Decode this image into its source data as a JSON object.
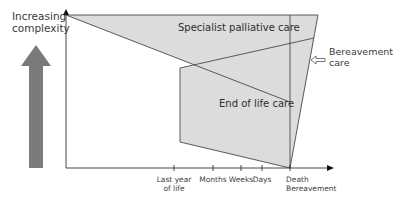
{
  "y_axis": {
    "label_line1": "Increasing",
    "label_line2": "complexity",
    "arrow": "up-arrow-icon"
  },
  "regions": {
    "specialist": "Specialist palliative care",
    "end_of_life": "End of life care",
    "bereavement_line1": "Bereavement",
    "bereavement_line2": "care"
  },
  "x_axis": {
    "ticks": [
      {
        "line1": "Last year",
        "line2": "of life"
      },
      {
        "line1": "Months",
        "line2": ""
      },
      {
        "line1": "Weeks",
        "line2": ""
      },
      {
        "line1": "Days",
        "line2": ""
      },
      {
        "line1": "Death",
        "line2": "Bereavement"
      }
    ]
  },
  "colors": {
    "fill": "#dedede",
    "stroke": "#4a4a4a",
    "big_arrow": "#7a7a7a"
  }
}
